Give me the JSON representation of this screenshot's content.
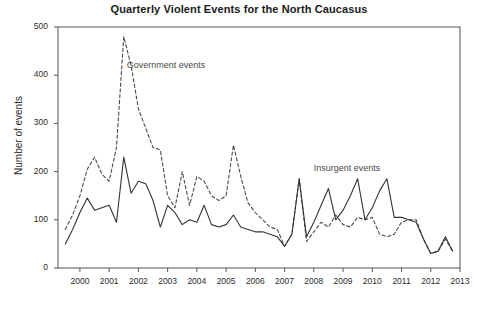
{
  "chart_data": {
    "type": "line",
    "title": "Quarterly Violent Events for the North Caucasus",
    "xlabel": "",
    "ylabel": "Number of events",
    "xlim": [
      1999.25,
      2013.0
    ],
    "ylim": [
      0,
      500
    ],
    "yticks": [
      0,
      100,
      200,
      300,
      400,
      500
    ],
    "xticks": [
      1999,
      2000,
      2001,
      2002,
      2003,
      2004,
      2005,
      2006,
      2007,
      2008,
      2009,
      2010,
      2011,
      2012,
      2013
    ],
    "grid": false,
    "legend": "annotations-inline",
    "annotations": [
      {
        "text": "Government events",
        "x": 2001.6,
        "y": 420,
        "series": "government"
      },
      {
        "text": "Insurgent events",
        "x": 2008.0,
        "y": 205,
        "series": "insurgent"
      }
    ],
    "x": [
      1999.5,
      1999.75,
      2000.0,
      2000.25,
      2000.5,
      2000.75,
      2001.0,
      2001.25,
      2001.5,
      2001.75,
      2002.0,
      2002.25,
      2002.5,
      2002.75,
      2003.0,
      2003.25,
      2003.5,
      2003.75,
      2004.0,
      2004.25,
      2004.5,
      2004.75,
      2005.0,
      2005.25,
      2005.5,
      2005.75,
      2006.0,
      2006.25,
      2006.5,
      2006.75,
      2007.0,
      2007.25,
      2007.5,
      2007.75,
      2008.0,
      2008.25,
      2008.5,
      2008.75,
      2009.0,
      2009.25,
      2009.5,
      2009.75,
      2010.0,
      2010.25,
      2010.5,
      2010.75,
      2011.0,
      2011.25,
      2011.5,
      2011.75,
      2012.0,
      2012.25,
      2012.5,
      2012.75
    ],
    "series": [
      {
        "name": "Government events",
        "style": "dashed",
        "color": "#4a4a4a",
        "values": [
          80,
          110,
          150,
          205,
          230,
          195,
          180,
          250,
          480,
          420,
          330,
          290,
          250,
          245,
          150,
          125,
          200,
          130,
          190,
          180,
          150,
          140,
          150,
          255,
          190,
          135,
          115,
          100,
          85,
          80,
          45,
          70,
          185,
          55,
          75,
          95,
          85,
          110,
          90,
          85,
          105,
          100,
          105,
          70,
          65,
          70,
          95,
          100,
          100,
          60,
          30,
          35,
          60,
          35
        ]
      },
      {
        "name": "Insurgent events",
        "style": "solid",
        "color": "#333333",
        "values": [
          50,
          80,
          115,
          145,
          120,
          125,
          130,
          95,
          230,
          155,
          180,
          175,
          140,
          85,
          130,
          115,
          90,
          100,
          95,
          130,
          90,
          85,
          90,
          110,
          85,
          80,
          75,
          75,
          70,
          65,
          45,
          70,
          185,
          65,
          95,
          130,
          165,
          100,
          120,
          150,
          185,
          100,
          125,
          160,
          185,
          105,
          105,
          100,
          95,
          60,
          30,
          35,
          65,
          35
        ]
      }
    ]
  },
  "axis": {
    "y_tick_labels": [
      "0",
      "100",
      "200",
      "300",
      "400",
      "500"
    ],
    "x_tick_labels": [
      "1999",
      "2000",
      "2001",
      "2002",
      "2003",
      "2004",
      "2005",
      "2006",
      "2007",
      "2008",
      "2009",
      "2010",
      "2011",
      "2012",
      "2013"
    ]
  },
  "colors": {
    "axis": "#555555",
    "title": "#1a1a1a",
    "government": "#4a4a4a",
    "insurgent": "#333333"
  }
}
